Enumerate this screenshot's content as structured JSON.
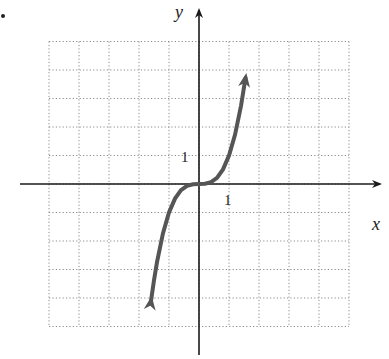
{
  "chart_data": {
    "type": "line",
    "title": "",
    "xlabel": "x",
    "ylabel": "y",
    "tick_labels": {
      "x": "1",
      "y": "1"
    },
    "xlim": [
      -5,
      5
    ],
    "ylim": [
      -5,
      5
    ],
    "grid": true,
    "grid_style": "dotted",
    "function": "y = x^3",
    "series": [
      {
        "name": "curve",
        "color": "#555555",
        "x": [
          -1.6,
          -1.5,
          -1.4,
          -1.2,
          -1.0,
          -0.8,
          -0.6,
          -0.4,
          -0.2,
          0,
          0.2,
          0.4,
          0.6,
          0.8,
          1.0,
          1.2,
          1.4,
          1.55
        ],
        "y": [
          -4.1,
          -3.375,
          -2.744,
          -1.728,
          -1.0,
          -0.512,
          -0.216,
          -0.064,
          -0.008,
          0,
          0.008,
          0.064,
          0.216,
          0.512,
          1.0,
          1.728,
          2.744,
          3.72
        ],
        "arrows": "both ends"
      }
    ]
  },
  "colors": {
    "axis": "#1a1a1a",
    "grid": "#8a8a8a",
    "curve": "#555555"
  }
}
